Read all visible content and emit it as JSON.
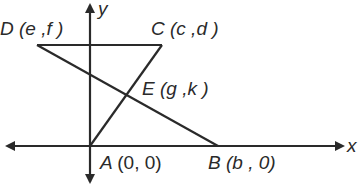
{
  "axes": {
    "x_label": "x",
    "y_label": "y"
  },
  "points": {
    "D": {
      "name": "D",
      "coords": "(e ,f )"
    },
    "C": {
      "name": "C",
      "coords": "(c ,d )"
    },
    "E": {
      "name": "E",
      "coords": "(g ,k )"
    },
    "A": {
      "name": "A",
      "coords": "(0, 0)"
    },
    "B": {
      "name": "B",
      "coords": "(b , 0)"
    }
  },
  "colors": {
    "stroke": "#2a2a2a",
    "background": "#ffffff"
  }
}
